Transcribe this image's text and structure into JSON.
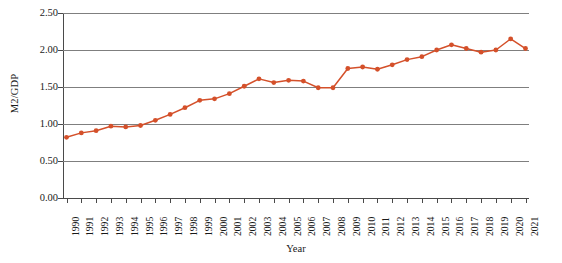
{
  "chart_data": {
    "type": "line",
    "title": "",
    "xlabel": "Year",
    "ylabel": "M2/GDP",
    "x": [
      1990,
      1991,
      1992,
      1993,
      1994,
      1995,
      1996,
      1997,
      1998,
      1999,
      2000,
      2001,
      2002,
      2003,
      2004,
      2005,
      2006,
      2007,
      2008,
      2009,
      2010,
      2011,
      2012,
      2013,
      2014,
      2015,
      2016,
      2017,
      2018,
      2019,
      2020,
      2021
    ],
    "categories": [
      "1990",
      "1991",
      "1992",
      "1993",
      "1994",
      "1995",
      "1996",
      "1997",
      "1998",
      "1999",
      "2000",
      "2001",
      "2002",
      "2003",
      "2004",
      "2005",
      "2006",
      "2007",
      "2008",
      "2009",
      "2010",
      "2011",
      "2012",
      "2013",
      "2014",
      "2015",
      "2016",
      "2017",
      "2018",
      "2019",
      "2020",
      "2021"
    ],
    "values": [
      0.82,
      0.88,
      0.91,
      0.97,
      0.96,
      0.98,
      1.05,
      1.13,
      1.22,
      1.32,
      1.34,
      1.41,
      1.51,
      1.61,
      1.56,
      1.59,
      1.58,
      1.49,
      1.49,
      1.75,
      1.77,
      1.74,
      1.8,
      1.87,
      1.91,
      2.0,
      2.07,
      2.02,
      1.97,
      2.0,
      2.15,
      2.02
    ],
    "series": [
      {
        "name": "M2/GDP",
        "values": [
          0.82,
          0.88,
          0.91,
          0.97,
          0.96,
          0.98,
          1.05,
          1.13,
          1.22,
          1.32,
          1.34,
          1.41,
          1.51,
          1.61,
          1.56,
          1.59,
          1.58,
          1.49,
          1.49,
          1.75,
          1.77,
          1.74,
          1.8,
          1.87,
          1.91,
          2.0,
          2.07,
          2.02,
          1.97,
          2.0,
          2.15,
          2.02
        ],
        "color": "#D4502A",
        "marker": "circle"
      }
    ],
    "ylim": [
      0.0,
      2.5
    ],
    "yticks": [
      0.0,
      0.5,
      1.0,
      1.5,
      2.0,
      2.5
    ],
    "ytick_labels": [
      "0.00",
      "0.50",
      "1.00",
      "1.50",
      "2.00",
      "2.50"
    ],
    "grid": true,
    "grid_axis": "y",
    "legend": false,
    "legend_position": "none",
    "line_color": "#D4502A",
    "marker_color": "#D4502A",
    "gridline_color": "#7F7F7F",
    "axis_color": "#4A4A4A",
    "background_color": "#FFFFFF"
  }
}
